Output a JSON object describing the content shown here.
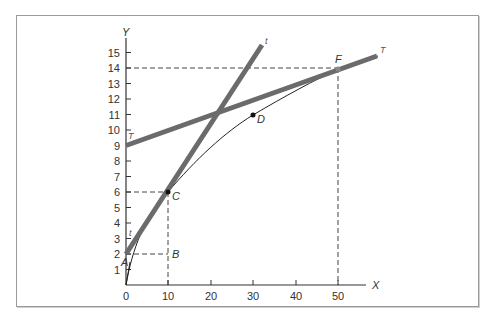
{
  "diagram": {
    "axes": {
      "x_label": "X",
      "y_label": "Y",
      "x_ticks": [
        "0",
        "10",
        "20",
        "30",
        "40",
        "50"
      ],
      "y_ticks": [
        "1",
        "2",
        "3",
        "4",
        "5",
        "6",
        "7",
        "8",
        "9",
        "10",
        "11",
        "12",
        "13",
        "14",
        "15"
      ]
    },
    "points": {
      "A": {
        "label": "A",
        "x": 0,
        "y": 2
      },
      "B": {
        "label": "B",
        "x": 10,
        "y": 2
      },
      "C": {
        "label": "C",
        "x": 10,
        "y": 6
      },
      "D": {
        "label": "D",
        "x": 30,
        "y": 11
      },
      "F": {
        "label": "F",
        "x": 50,
        "y": 14
      }
    },
    "lines": {
      "t": {
        "label": "t",
        "label_lower": "t",
        "from": [
          0,
          2
        ],
        "to": [
          32,
          15.5
        ]
      },
      "T": {
        "label": "T",
        "label_left": "T",
        "from": [
          0,
          9
        ],
        "to": [
          59,
          14.8
        ]
      }
    },
    "colors": {
      "thick_line": "#6b6b6b",
      "curve": "#222222",
      "dashed": "#444444",
      "frame": "#9a9a9a"
    }
  }
}
